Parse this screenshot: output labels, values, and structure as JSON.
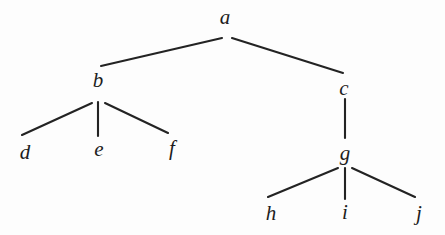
{
  "diagram": {
    "type": "tree",
    "title": "",
    "background_color": "#fdfdfd",
    "line_color": "#232323",
    "label_color": "#1d1d1d",
    "width": 445,
    "height": 235,
    "nodes": [
      {
        "id": "a",
        "label": "a",
        "x": 225,
        "y": 17,
        "depth": 0,
        "parent": null
      },
      {
        "id": "b",
        "label": "b",
        "x": 98,
        "y": 80,
        "depth": 1,
        "parent": "a"
      },
      {
        "id": "c",
        "label": "c",
        "x": 344,
        "y": 88,
        "depth": 1,
        "parent": "a"
      },
      {
        "id": "d",
        "label": "d",
        "x": 25,
        "y": 152,
        "depth": 2,
        "parent": "b"
      },
      {
        "id": "e",
        "label": "e",
        "x": 99,
        "y": 149,
        "depth": 2,
        "parent": "b"
      },
      {
        "id": "f",
        "label": "f",
        "x": 172,
        "y": 148,
        "depth": 2,
        "parent": "b"
      },
      {
        "id": "g",
        "label": "g",
        "x": 345,
        "y": 153,
        "depth": 2,
        "parent": "c"
      },
      {
        "id": "h",
        "label": "h",
        "x": 271,
        "y": 213,
        "depth": 3,
        "parent": "g"
      },
      {
        "id": "i",
        "label": "i",
        "x": 345,
        "y": 212,
        "depth": 3,
        "parent": "g"
      },
      {
        "id": "j",
        "label": "j",
        "x": 419,
        "y": 213,
        "depth": 3,
        "parent": "g"
      }
    ],
    "edges": [
      {
        "from": "a",
        "to": "b",
        "x1": 222,
        "y1": 38,
        "x2": 101,
        "y2": 66
      },
      {
        "from": "a",
        "to": "c",
        "x1": 232,
        "y1": 38,
        "x2": 343,
        "y2": 73
      },
      {
        "from": "b",
        "to": "d",
        "x1": 92,
        "y1": 103,
        "x2": 22,
        "y2": 135
      },
      {
        "from": "b",
        "to": "e",
        "x1": 98,
        "y1": 102,
        "x2": 98,
        "y2": 136
      },
      {
        "from": "b",
        "to": "f",
        "x1": 105,
        "y1": 103,
        "x2": 168,
        "y2": 133
      },
      {
        "from": "c",
        "to": "g",
        "x1": 345,
        "y1": 99,
        "x2": 345,
        "y2": 138
      },
      {
        "from": "g",
        "to": "h",
        "x1": 338,
        "y1": 168,
        "x2": 268,
        "y2": 197
      },
      {
        "from": "g",
        "to": "i",
        "x1": 345,
        "y1": 168,
        "x2": 345,
        "y2": 199
      },
      {
        "from": "g",
        "to": "j",
        "x1": 352,
        "y1": 168,
        "x2": 415,
        "y2": 197
      }
    ]
  }
}
